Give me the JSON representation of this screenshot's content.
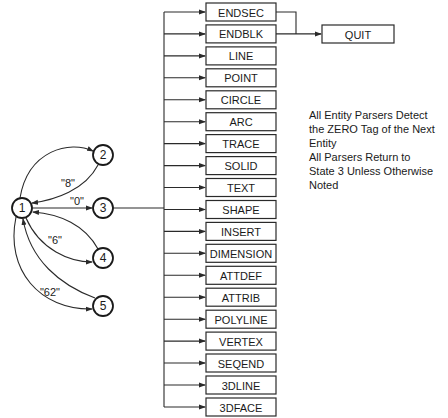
{
  "diagram": {
    "states": [
      {
        "id": "1",
        "label": "1"
      },
      {
        "id": "2",
        "label": "2"
      },
      {
        "id": "3",
        "label": "3"
      },
      {
        "id": "4",
        "label": "4"
      },
      {
        "id": "5",
        "label": "5"
      }
    ],
    "edge_labels": {
      "to_2": "\"8\"",
      "to_3": "\"0\"",
      "to_4": "\"6\"",
      "to_5": "\"62\""
    },
    "entities": [
      "ENDSEC",
      "ENDBLK",
      "LINE",
      "POINT",
      "CIRCLE",
      "ARC",
      "TRACE",
      "SOLID",
      "TEXT",
      "SHAPE",
      "INSERT",
      "DIMENSION",
      "ATTDEF",
      "ATTRIB",
      "POLYLINE",
      "VERTEX",
      "SEQEND",
      "3DLINE",
      "3DFACE"
    ],
    "quit_label": "QUIT",
    "notes": [
      "All Entity Parsers Detect",
      "the ZERO Tag of the Next",
      "Entity",
      "All Parsers Return to",
      "State 3 Unless Otherwise",
      "Noted"
    ],
    "colors": {
      "stroke": "#2a2a2a",
      "text": "#1a1a1a",
      "background": "#ffffff"
    }
  }
}
